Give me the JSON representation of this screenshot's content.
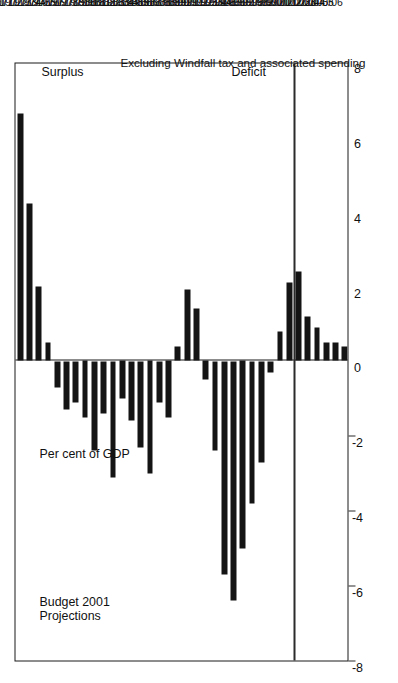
{
  "chart_data": {
    "type": "bar",
    "title": "",
    "subtitle": "",
    "xlabel": "",
    "ylabel": "Per cent of GDP",
    "orientation": "vertical-bars-on-sideways-page",
    "grid": false,
    "legend": "none",
    "ylim": [
      -8,
      8
    ],
    "yticks": [
      8,
      6,
      4,
      2,
      0,
      -2,
      -4,
      -6,
      -8
    ],
    "ytick_labels": [
      "8",
      "6",
      "4",
      "2",
      "0",
      "-2",
      "-4",
      "-6",
      "-8"
    ],
    "positive_direction_label": "Surplus",
    "negative_direction_label": "Deficit",
    "annotations": [
      "Budget 2001\nProjections",
      "Per cent of GDP",
      "Surplus",
      "Deficit",
      "Excluding Windfall tax and associated spending"
    ],
    "projection_start_category": "2000/01",
    "categories": [
      "1970/71",
      "1971/72",
      "1972/73",
      "1973/74",
      "1974/75",
      "1975/76",
      "1976/77",
      "1977/78",
      "1978/79",
      "1979/80",
      "1980/81",
      "1981/82",
      "1982/83",
      "1983/84",
      "1984/85",
      "1985/86",
      "1986/87",
      "1987/88",
      "1988/89",
      "1989/90",
      "1990/91",
      "1991/92",
      "1992/93",
      "1993/94",
      "1994/95",
      "1995/96",
      "1996/97",
      "1997/98",
      "1998/99",
      "1999/00",
      "2000/01",
      "2001/02",
      "2002/03",
      "2003/04",
      "2004/05",
      "2005/06"
    ],
    "values": [
      6.6,
      4.2,
      2.0,
      0.5,
      -0.7,
      -1.3,
      -1.1,
      -1.5,
      -2.4,
      -1.4,
      -3.1,
      -1.0,
      -1.6,
      -2.3,
      -3.0,
      -1.1,
      -1.5,
      0.4,
      1.9,
      1.4,
      -0.5,
      -2.4,
      -5.7,
      -6.4,
      -5.0,
      -3.8,
      -2.7,
      -0.3,
      0.8,
      2.1,
      2.4,
      1.2,
      0.9,
      0.5,
      0.5,
      0.4
    ]
  },
  "axis": {
    "value_ticks": [
      "8",
      "6",
      "4",
      "2",
      "0",
      "-2",
      "-4",
      "-6",
      "-8"
    ],
    "category_labels": [
      "1970/71",
      "1971/72",
      "1972/73",
      "1973/74",
      "1974/75",
      "1975/76",
      "1976/77",
      "1977/78",
      "1978/79",
      "1979/80",
      "1980/81",
      "1981/82",
      "1982/83",
      "1983/84",
      "1984/85",
      "1985/86",
      "1986/87",
      "1987/88",
      "1988/89",
      "1989/90",
      "1990/91",
      "1991/92",
      "1992/93",
      "1993/94",
      "1994/95",
      "1995/96",
      "1996/97",
      "1997/98",
      "1998/99",
      "1999/00",
      "2000/01",
      "2001/02",
      "2002/03",
      "2003/04",
      "2004/05",
      "2005/06"
    ]
  },
  "labels": {
    "projections": "Budget 2001\nProjections",
    "percent_of_gdp": "Per cent of GDP",
    "surplus": "Surplus",
    "deficit": "Deficit",
    "footnote": "Excluding Windfall tax and associated spending"
  },
  "colors": {
    "bar": "#141414",
    "axis": "#1a1a1a",
    "background": "#ffffff",
    "text": "#111111"
  }
}
